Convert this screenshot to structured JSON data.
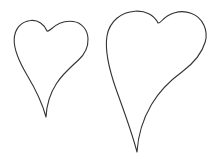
{
  "canvas": {
    "width": 220,
    "height": 164,
    "background_color": "#ffffff",
    "title": "Two hand-drawn heart outlines"
  },
  "style": {
    "stroke_color": "#333333",
    "stroke_width": 1.1,
    "fill": "none"
  },
  "shapes": [
    {
      "name": "small-heart",
      "label": "Small heart outline",
      "stroke_color": "#333333",
      "stroke_width": 1.1,
      "bounds": {
        "left": 14,
        "top": 22,
        "right": 88,
        "bottom": 118
      },
      "cleft_point": {
        "x": 47,
        "y": 31
      },
      "bottom_tip": {
        "x": 46,
        "y": 117
      },
      "path": "M 47 31 C 44.5 24.5 38 19.5 30.5 20.5 C 21 21.5 14.5 29 14.2 39.5 C 13.9 50 19 61.5 27 75 C 34.5 87.5 42 102 46 117 C 46.6 105 50 93.5 56.5 83.5 C 63 73.5 71.5 66.5 78.5 60 C 85.5 53.5 88.3 46.5 88 39 C 87.7 30 82 22.5 73 21.5 C 64.5 20.5 56.5 24 50.5 29.5 C 49.2 30.7 48 31.4 47 31 Z"
    },
    {
      "name": "large-heart",
      "label": "Large heart outline",
      "stroke_color": "#333333",
      "stroke_width": 1.1,
      "bounds": {
        "left": 106,
        "top": 11,
        "right": 206,
        "bottom": 153
      },
      "cleft_point": {
        "x": 158,
        "y": 23
      },
      "bottom_tip": {
        "x": 137,
        "y": 152
      },
      "path": "M 158 23 C 154 14.5 145 10.5 135 11.2 C 121.5 12 109.5 21 107 36 C 104.5 51 109 69 116 89 C 123.5 110 131.5 131 137 152 C 138 135 143 119 151.5 104.5 C 160 90 171.5 79.5 182.5 71.5 C 194.5 62.5 202 53 205.2 42 C 208.5 30.5 203 17.5 191 13.2 C 180 9.2 168.5 13.5 162 20.5 C 160.3 22.3 159 23.4 158 23 Z"
    }
  ]
}
